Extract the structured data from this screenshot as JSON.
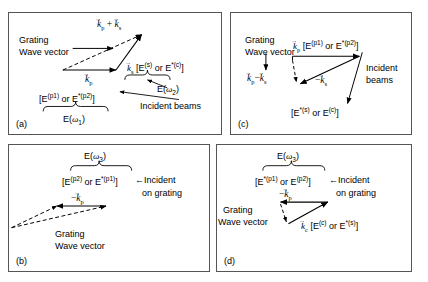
{
  "figure": {
    "panels": [
      {
        "tag": "(a)",
        "grating_label_line1": "Grating",
        "grating_label_line2": "Wave vector",
        "sum_vector": "k⃗p + k⃗s",
        "kp_label": "kp",
        "ks_label": "ks",
        "ks_field": "[E(s) or E*(c)]",
        "omega2": "E(ω2)",
        "incident": "Incident beams",
        "brace_field": "[E(p1) or E*(p2)]",
        "omega1": "E(ω1)"
      },
      {
        "tag": "(c)",
        "grating_label_line1": "Grating",
        "grating_label_line2": "Wave vector",
        "grating_vector": "k⃗p − k⃗s",
        "kp_field": "k⃗p [E(p1) or E*(p2)]",
        "minus_ks": "− k⃗s",
        "incident_line1": "Incident",
        "incident_line2": "beams",
        "bottom_field": "[E*(s) or E(c)]"
      },
      {
        "tag": "(b)",
        "omega3": "E(ω3)",
        "brace_field": "[E(p2) or E*(p1)]",
        "incident_line1": "←Incident",
        "incident_line2": "on grating",
        "minus_kp": "−k⃗p",
        "grating_label_line1": "Grating",
        "grating_label_line2": "Wave vector"
      },
      {
        "tag": "(d)",
        "omega3": "E(ω3)",
        "brace_field": "[E*(p1) or E(p2)]",
        "incident_line1": "←Incident",
        "incident_line2": "on grating",
        "minus_kp": "− k⃗p",
        "grating_label_line1": "Grating",
        "grating_label_line2": "Wave vector",
        "kc_field": "k⃗c [E(c) or E*(s)]"
      }
    ]
  },
  "colors": {
    "ink": "#000000",
    "border": "#555555",
    "background": "#ffffff"
  }
}
